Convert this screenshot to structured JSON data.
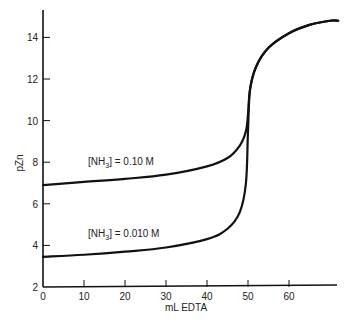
{
  "chart_data": {
    "type": "line",
    "title": "",
    "xlabel": "mL EDTA",
    "ylabel": "pZn",
    "xlim": [
      0,
      72
    ],
    "ylim": [
      2,
      15.5
    ],
    "xticks": [
      0,
      10,
      20,
      30,
      40,
      50,
      60
    ],
    "yticks": [
      2,
      4,
      6,
      8,
      10,
      12,
      14
    ],
    "grid": false,
    "legend": "none (inline curve annotations)",
    "series": [
      {
        "name": "[NH3] = 0.10 M",
        "x": [
          0,
          10,
          20,
          30,
          40,
          45,
          48,
          49.5,
          50,
          50.5,
          52,
          55,
          60,
          65,
          70,
          72
        ],
        "y": [
          6.9,
          7.05,
          7.2,
          7.4,
          7.8,
          8.2,
          8.8,
          9.5,
          10.3,
          11.5,
          12.6,
          13.5,
          14.2,
          14.6,
          14.8,
          14.8
        ]
      },
      {
        "name": "[NH3] = 0.010 M",
        "x": [
          0,
          10,
          20,
          30,
          40,
          45,
          48,
          49.5,
          50,
          50.5,
          52,
          55,
          60,
          65,
          70,
          72
        ],
        "y": [
          3.45,
          3.55,
          3.7,
          3.9,
          4.3,
          4.8,
          5.6,
          7.0,
          9.5,
          11.5,
          12.6,
          13.5,
          14.2,
          14.6,
          14.8,
          14.8
        ]
      }
    ],
    "annotations": [
      {
        "text": "[NH3] = 0.10 M",
        "x": 20,
        "y": 8.1
      },
      {
        "text": "[NH3] = 0.010 M",
        "x": 20,
        "y": 4.6
      }
    ]
  },
  "labels": {
    "xlabel": "mL EDTA",
    "ylabel": "pZn",
    "annot_upper_prefix": "[NH",
    "annot_upper_sub": "3",
    "annot_upper_suffix": "] = 0.10 M",
    "annot_lower_prefix": "[NH",
    "annot_lower_sub": "3",
    "annot_lower_suffix": "] = 0.010 M"
  }
}
